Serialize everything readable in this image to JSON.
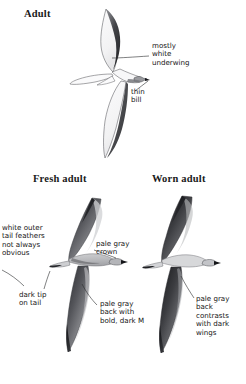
{
  "plate": {
    "background_color": "#ffffff",
    "ink_color": "#141414",
    "panels": [
      {
        "name": "adult",
        "heading": "Adult"
      },
      {
        "name": "fresh-adult",
        "heading": "Fresh adult"
      },
      {
        "name": "worn-adult",
        "heading": "Worn adult"
      }
    ]
  },
  "headings": {
    "adult": "Adult",
    "fresh_adult": "Fresh adult",
    "worn_adult": "Worn adult"
  },
  "annotations": {
    "mostly_white_underwing": "mostly\nwhite\nunderwing",
    "thin_bill": "thin\nbill",
    "white_outer_tail_feathers": "white outer\ntail feathers\nnot always\nobvious",
    "dark_tip_on_tail": "dark tip\non tail",
    "pale_gray_crown": "pale gray\ncrown",
    "pale_gray_back_with_bold_dark_m": "pale gray\nback with\nbold, dark M",
    "pale_gray_back_contrasts": "pale gray\nback\ncontrasts\nwith dark\nwings"
  },
  "figures": {
    "adult": {
      "view": "underside",
      "label": "petrel-in-flight-underside"
    },
    "fresh_adult": {
      "view": "upperside",
      "label": "petrel-in-flight-upperside-fresh"
    },
    "worn_adult": {
      "view": "upperside",
      "label": "petrel-in-flight-upperside-worn"
    }
  }
}
